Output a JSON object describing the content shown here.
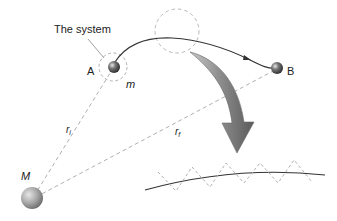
{
  "labels": {
    "system": "The system",
    "point_a": "A",
    "point_b": "B",
    "small_mass": "m",
    "large_mass": "M",
    "r_initial_main": "r",
    "r_initial_sub": "i",
    "r_final_main": "r",
    "r_final_sub": "f"
  },
  "colors": {
    "background": "#ffffff",
    "dashed_line": "#b0b0b0",
    "trajectory": "#333333",
    "arrow_fill": "#8a8a8a",
    "arrow_dark": "#5e5e5e",
    "sphere_small": "#555555",
    "sphere_large": "#9a9a9a"
  }
}
